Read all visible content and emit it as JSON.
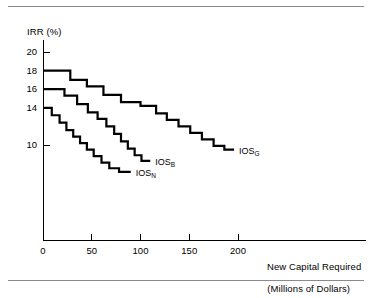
{
  "figure": {
    "top_rule": "horizontal-rule",
    "bottom_rule": "horizontal-rule"
  },
  "chart_data": {
    "type": "line",
    "title": "",
    "subtitle": "",
    "xlabel": "New Capital Required",
    "xlabel_line2": "(Millions of Dollars)",
    "ylabel": "IRR (%)",
    "step_style": "post",
    "grid": false,
    "legend_position": "inline-end-of-series",
    "xlim": [
      0,
      235
    ],
    "ylim": [
      5,
      21
    ],
    "xticks": [
      0,
      50,
      100,
      150,
      200
    ],
    "xtick_labels": [
      "0",
      "50",
      "100",
      "150",
      "200"
    ],
    "yticks": [
      20,
      18,
      16,
      14,
      10
    ],
    "ytick_labels": [
      "20",
      "18",
      "16",
      "14",
      "10"
    ],
    "series": [
      {
        "name": "IOS_G",
        "label_text": "IOS",
        "label_sub": "G",
        "values": [
          18.0,
          17.0,
          16.3,
          15.4,
          14.6,
          14.2,
          13.4,
          12.7,
          12.0,
          11.3,
          10.6,
          9.9,
          9.5
        ],
        "x_breaks": [
          0,
          28,
          45,
          62,
          80,
          100,
          116,
          127,
          139,
          151,
          163,
          175,
          186,
          196
        ]
      },
      {
        "name": "IOS_B",
        "label_text": "IOS",
        "label_sub": "B",
        "values": [
          16.0,
          15.3,
          14.4,
          13.5,
          12.8,
          12.0,
          11.2,
          10.4,
          9.6,
          8.9,
          8.3
        ],
        "x_breaks": [
          0,
          22,
          35,
          46,
          56,
          65,
          73,
          80,
          87,
          94,
          101,
          110
        ]
      },
      {
        "name": "IOS_N",
        "label_text": "IOS",
        "label_sub": "N",
        "values": [
          14.0,
          13.2,
          12.4,
          11.6,
          10.9,
          10.2,
          9.5,
          8.8,
          8.1,
          7.5,
          7.1
        ],
        "x_breaks": [
          0,
          9,
          17,
          24,
          31,
          38,
          45,
          52,
          60,
          68,
          78,
          90
        ]
      }
    ],
    "annotations": [
      {
        "name": "IOS_G",
        "x": 196,
        "y": 9.5
      },
      {
        "name": "IOS_B",
        "x": 110,
        "y": 8.3
      },
      {
        "name": "IOS_N",
        "x": 90,
        "y": 7.1
      }
    ]
  }
}
